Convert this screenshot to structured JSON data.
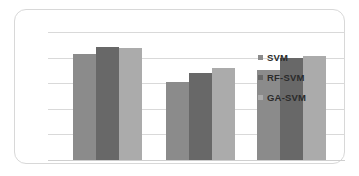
{
  "chart_data": {
    "type": "bar",
    "title": "",
    "subtitle": "",
    "xlabel": "",
    "ylabel": "",
    "categories": [
      "Group 1",
      "Group 2",
      "Group 3"
    ],
    "series": [
      {
        "name": "SVM",
        "color": "#8b8b8b",
        "values": [
          0.83,
          0.61,
          0.7
        ]
      },
      {
        "name": "RF-SVM",
        "color": "#686868",
        "values": [
          0.88,
          0.68,
          0.8
        ]
      },
      {
        "name": "GA-SVM",
        "color": "#ababab",
        "values": [
          0.875,
          0.72,
          0.81
        ]
      }
    ],
    "ylim": [
      0,
      1.0
    ],
    "grid": true,
    "gridlines": [
      0.0,
      0.2,
      0.4,
      0.6,
      0.8,
      1.0
    ],
    "legend_position": "inside-right",
    "x_tick_labels": [],
    "y_tick_labels": []
  },
  "legend": {
    "entries": [
      {
        "label": "SVM"
      },
      {
        "label": "RF-SVM"
      },
      {
        "label": "GA-SVM"
      }
    ]
  },
  "colors": {
    "series_1": "#8b8b8b",
    "series_2": "#686868",
    "series_3": "#ababab",
    "gridline": "#d9d9d9",
    "frame_border": "#d8d8d8",
    "background": "#ffffff",
    "legend_text": "#2b2b2b"
  }
}
